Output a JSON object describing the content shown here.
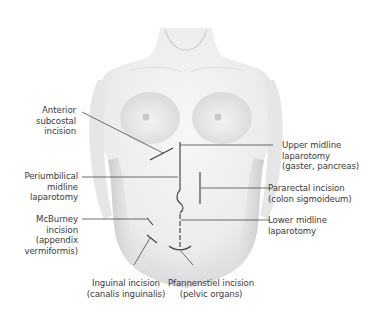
{
  "figure": {
    "leader_color": "#4a4a4a",
    "incision_color": "#3a3a3a"
  },
  "labels": {
    "anterior_subcostal": [
      "Anterior",
      "subcostal",
      "incision"
    ],
    "periumbilical": [
      "Periumbilical",
      "midline",
      "laparotomy"
    ],
    "mcburney": [
      "McBurney",
      "incision",
      "(appendix",
      "vermiformis)"
    ],
    "upper_midline": [
      "Upper midline",
      "laparotomy",
      "(gaster, pancreas)"
    ],
    "pararectal": [
      "Pararectal incision",
      "(colon sigmoideum)"
    ],
    "lower_midline": [
      "Lower midline",
      "laparotomy"
    ],
    "inguinal": [
      "Inguinal incision",
      "(canalis inguinalis)"
    ],
    "pfannenstiel": [
      "Pfannenstiel incision",
      "(pelvic organs)"
    ]
  }
}
